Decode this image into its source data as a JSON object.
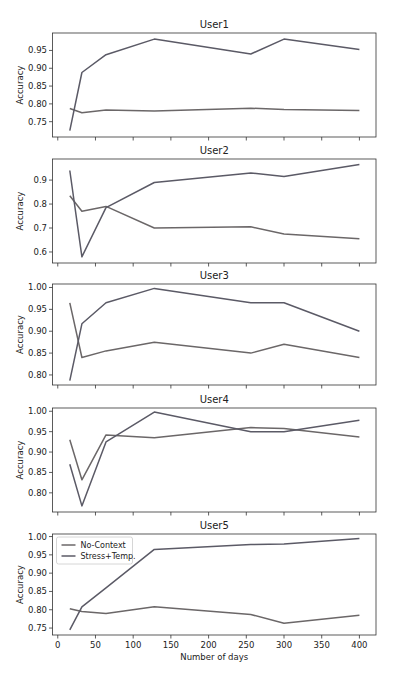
{
  "chart_data": [
    {
      "type": "line",
      "title": "User1",
      "xlabel": "",
      "ylabel": "Accuracy",
      "x": [
        16,
        32,
        64,
        128,
        256,
        300,
        400
      ],
      "xlim": [
        -7,
        422
      ],
      "ylim": [
        0.707,
        0.999
      ],
      "yticks": [
        0.75,
        0.8,
        0.85,
        0.9,
        0.95
      ],
      "ytick_labels": [
        "0.75",
        "0.80",
        "0.85",
        "0.90",
        "0.95"
      ],
      "xticks": [
        0,
        50,
        100,
        150,
        200,
        250,
        300,
        350,
        400
      ],
      "show_xtick_labels": false,
      "grid": false,
      "series": [
        {
          "name": "No-Context",
          "values": [
            0.787,
            0.775,
            0.783,
            0.78,
            0.788,
            0.784,
            0.781
          ]
        },
        {
          "name": "Stress+Temp.",
          "values": [
            0.725,
            0.888,
            0.938,
            0.982,
            0.94,
            0.982,
            0.953
          ]
        }
      ]
    },
    {
      "type": "line",
      "title": "User2",
      "xlabel": "",
      "ylabel": "Accuracy",
      "x": [
        16,
        32,
        64,
        128,
        256,
        300,
        400
      ],
      "xlim": [
        -7,
        422
      ],
      "ylim": [
        0.554,
        0.988
      ],
      "yticks": [
        0.6,
        0.7,
        0.8,
        0.9
      ],
      "ytick_labels": [
        "0.6",
        "0.7",
        "0.8",
        "0.9"
      ],
      "xticks": [
        0,
        50,
        100,
        150,
        200,
        250,
        300,
        350,
        400
      ],
      "show_xtick_labels": false,
      "grid": false,
      "series": [
        {
          "name": "No-Context",
          "values": [
            0.835,
            0.77,
            0.79,
            0.7,
            0.705,
            0.675,
            0.655
          ]
        },
        {
          "name": "Stress+Temp.",
          "values": [
            0.94,
            0.58,
            0.785,
            0.89,
            0.93,
            0.915,
            0.965
          ]
        }
      ]
    },
    {
      "type": "line",
      "title": "User3",
      "xlabel": "",
      "ylabel": "Accuracy",
      "x": [
        16,
        32,
        64,
        128,
        256,
        300,
        400
      ],
      "xlim": [
        -7,
        422
      ],
      "ylim": [
        0.777,
        1.008
      ],
      "yticks": [
        0.8,
        0.85,
        0.9,
        0.95,
        1.0
      ],
      "ytick_labels": [
        "0.80",
        "0.85",
        "0.90",
        "0.95",
        "1.00"
      ],
      "xticks": [
        0,
        50,
        100,
        150,
        200,
        250,
        300,
        350,
        400
      ],
      "show_xtick_labels": false,
      "grid": false,
      "series": [
        {
          "name": "No-Context",
          "values": [
            0.965,
            0.84,
            0.855,
            0.875,
            0.85,
            0.87,
            0.84
          ]
        },
        {
          "name": "Stress+Temp.",
          "values": [
            0.787,
            0.917,
            0.965,
            0.998,
            0.965,
            0.965,
            0.9
          ]
        }
      ]
    },
    {
      "type": "line",
      "title": "User4",
      "xlabel": "",
      "ylabel": "Accuracy",
      "x": [
        16,
        32,
        64,
        128,
        256,
        300,
        400
      ],
      "xlim": [
        -7,
        422
      ],
      "ylim": [
        0.753,
        1.008
      ],
      "yticks": [
        0.8,
        0.85,
        0.9,
        0.95,
        1.0
      ],
      "ytick_labels": [
        "0.80",
        "0.85",
        "0.90",
        "0.95",
        "1.00"
      ],
      "xticks": [
        0,
        50,
        100,
        150,
        200,
        250,
        300,
        350,
        400
      ],
      "show_xtick_labels": false,
      "grid": false,
      "series": [
        {
          "name": "No-Context",
          "values": [
            0.93,
            0.832,
            0.942,
            0.935,
            0.96,
            0.958,
            0.937
          ]
        },
        {
          "name": "Stress+Temp.",
          "values": [
            0.87,
            0.768,
            0.925,
            0.998,
            0.95,
            0.95,
            0.978
          ]
        }
      ]
    },
    {
      "type": "line",
      "title": "User5",
      "xlabel": "Number of days",
      "ylabel": "Accuracy",
      "x": [
        16,
        32,
        64,
        128,
        256,
        300,
        400
      ],
      "xlim": [
        -7,
        422
      ],
      "ylim": [
        0.731,
        1.007
      ],
      "yticks": [
        0.75,
        0.8,
        0.85,
        0.9,
        0.95,
        1.0
      ],
      "ytick_labels": [
        "0.75",
        "0.80",
        "0.85",
        "0.90",
        "0.95",
        "1.00"
      ],
      "xticks": [
        0,
        50,
        100,
        150,
        200,
        250,
        300,
        350,
        400
      ],
      "xtick_labels": [
        "0",
        "50",
        "100",
        "150",
        "200",
        "250",
        "300",
        "350",
        "400"
      ],
      "show_xtick_labels": true,
      "grid": false,
      "legend": {
        "position": "upper left",
        "entries": [
          "No-Context",
          "Stress+Temp."
        ]
      },
      "series": [
        {
          "name": "No-Context",
          "values": [
            0.803,
            0.795,
            0.79,
            0.808,
            0.787,
            0.763,
            0.785
          ]
        },
        {
          "name": "Stress+Temp.",
          "values": [
            0.745,
            0.808,
            0.86,
            0.965,
            0.978,
            0.98,
            0.995
          ]
        }
      ]
    }
  ],
  "style": {
    "series_colors": {
      "No-Context": "#6b6768",
      "Stress+Temp.": "#5b5a66"
    },
    "axes_color": "#333333",
    "background": "#ffffff"
  }
}
